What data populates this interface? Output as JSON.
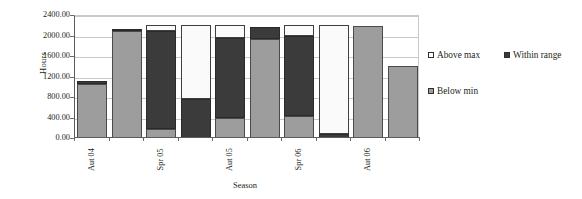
{
  "chart_data": {
    "type": "bar",
    "stacked": true,
    "title": "",
    "xlabel": "Season",
    "ylabel": "Hours",
    "ylim": [
      0,
      2400
    ],
    "ytick_values": [
      0,
      400,
      800,
      1200,
      1600,
      2000,
      2400
    ],
    "ytick_labels": [
      "0.00",
      "400.00",
      "800.00",
      "1200.00",
      "1600.00",
      "2000.00",
      "2400.00"
    ],
    "grid": true,
    "legend_position": "right",
    "categories": [
      "Aut 04",
      "",
      "Spr 05",
      "",
      "Aut 05",
      "",
      "Spr 06",
      "",
      "Aut 06",
      ""
    ],
    "xtick_labels": [
      "Aut 04",
      "Spr 05",
      "Aut 05",
      "Spr 06",
      "Aut 06"
    ],
    "xtick_label_bar_index": [
      0,
      2,
      4,
      6,
      8
    ],
    "series": [
      {
        "name": "Below min",
        "color": "#9d9d9d",
        "values": [
          1050,
          2080,
          170,
          0,
          400,
          1940,
          430,
          0,
          2190,
          1400
        ]
      },
      {
        "name": "Within range",
        "color": "#3b3b3b",
        "values": [
          60,
          50,
          1910,
          760,
          1560,
          230,
          1570,
          80,
          0,
          0
        ]
      },
      {
        "name": "Above max",
        "color": "#ffffff",
        "values": [
          0,
          0,
          120,
          1440,
          240,
          0,
          200,
          2120,
          0,
          0
        ]
      }
    ],
    "bar_totals": [
      1110,
      2130,
      2200,
      2200,
      2200,
      2170,
      2200,
      2200,
      2190,
      1400
    ]
  },
  "legend": {
    "entries": [
      {
        "label": "Above max",
        "swatch": "above"
      },
      {
        "label": "Within range",
        "swatch": "within"
      },
      {
        "label": "Below min",
        "swatch": "below"
      }
    ]
  },
  "axes": {
    "y_title": "Hours",
    "x_title": "Season"
  }
}
